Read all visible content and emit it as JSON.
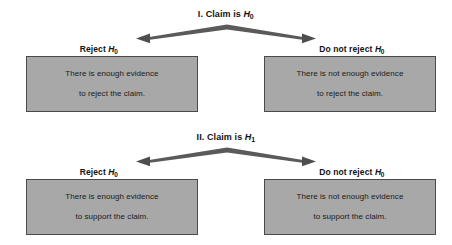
{
  "figure": {
    "background_color": "#ffffff",
    "box_fill_color": "#a8a8a8",
    "box_border_color": "#4a4a4a",
    "arrow_color": "#555555",
    "text_color": "#121212"
  },
  "panels": [
    {
      "id": "panel-1",
      "number": "I.",
      "title_prefix": "I. Claim is ",
      "title_var": "H",
      "title_sub": "0",
      "branches": [
        {
          "label_prefix": "Reject ",
          "label_var": "H",
          "label_sub": "0",
          "box_line_1": "There is enough evidence",
          "box_line_2": "to reject the claim."
        },
        {
          "label_prefix": "Do not reject ",
          "label_var": "H",
          "label_sub": "0",
          "box_line_1": "There is not enough evidence",
          "box_line_2": "to reject the claim."
        }
      ]
    },
    {
      "id": "panel-2",
      "number": "II.",
      "title_prefix": "II. Claim is ",
      "title_var": "H",
      "title_sub": "1",
      "branches": [
        {
          "label_prefix": "Reject ",
          "label_var": "H",
          "label_sub": "0",
          "box_line_1": "There is enough evidence",
          "box_line_2": "to support the claim."
        },
        {
          "label_prefix": "Do not reject ",
          "label_var": "H",
          "label_sub": "0",
          "box_line_1": "There is not enough evidence",
          "box_line_2": "to support the claim."
        }
      ]
    }
  ]
}
